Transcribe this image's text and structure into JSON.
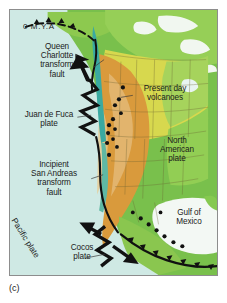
{
  "figure": {
    "caption": "(c)",
    "age_label": "0 M.Y.A"
  },
  "map": {
    "ocean_color": "#cfe9e4",
    "gulf_color": "#f2f7f3",
    "lowland_green_color": "#7cc24a",
    "plains_yellow_color": "#d8d84f",
    "upland_orange_color": "#d99a3c",
    "highland_tan_color": "#e0b36a",
    "coast_teal_color": "#3aa8a0",
    "line_color": "#1b1b1b",
    "frame_color": "#8d8d8d"
  },
  "labels": {
    "queen_charlotte": "Queen\nCharlotte\ntransform\nfault",
    "juan_de_fuca": "Juan de Fuca\nplate",
    "incipient_san_andreas": "Incipient\nSan Andreas\ntransform\nfault",
    "pacific_plate": "Pacific plate",
    "cocos_plate": "Cocos\nplate",
    "present_day_volcanoes": "Present day\nvolcanoes",
    "north_american_plate": "North\nAmerican\nplate",
    "gulf_of_mexico": "Gulf of\nMexico"
  },
  "features": {
    "volcano_marker": "volcano-dot",
    "ridge_marker": "spreading-ridge-zigzag",
    "trench_marker": "subduction-trench-teeth",
    "arrow_marker": "plate-motion-arrow",
    "volcano_count": 22
  }
}
